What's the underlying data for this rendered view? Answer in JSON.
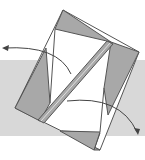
{
  "diagram": {
    "type": "origami-fold-step",
    "colors": {
      "background_band": "#d8d8d8",
      "paper_white": "#ffffff",
      "paper_shaded": "#a8a8a8",
      "line": "#555555",
      "arrow": "#444444"
    },
    "arrows": [
      {
        "name": "fold-left-arrow",
        "direction": "left"
      },
      {
        "name": "fold-right-arrow",
        "direction": "down-right"
      }
    ]
  }
}
